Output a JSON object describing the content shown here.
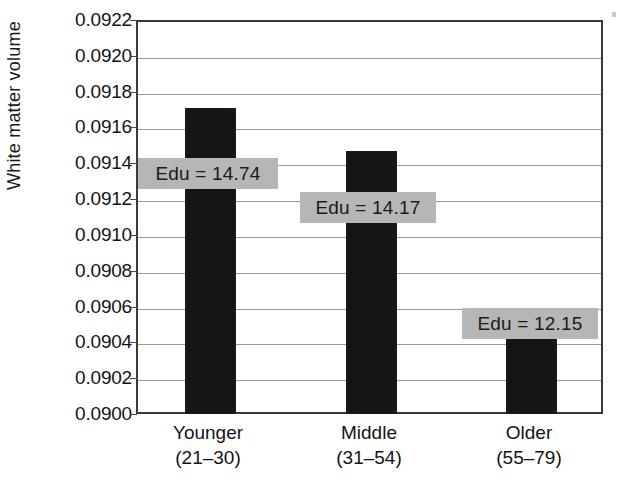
{
  "chart_data": {
    "type": "bar",
    "title": "",
    "xlabel": "",
    "ylabel": "White matter volume",
    "categories": [
      "Younger",
      "Middle",
      "Older"
    ],
    "category_ranges": [
      "(21–30)",
      "(31–54)",
      "(55–79)"
    ],
    "values": [
      0.09172,
      0.09148,
      0.0906
    ],
    "ylim": [
      0.09,
      0.0922
    ],
    "ytick_step": 0.0002,
    "ytick_labels": [
      "0.0922",
      "0.0920",
      "0.0918",
      "0.0916",
      "0.0914",
      "0.0912",
      "0.0910",
      "0.0908",
      "0.0906",
      "0.0904",
      "0.0902",
      "0.0900"
    ],
    "ytick_values": [
      0.0922,
      0.092,
      0.0918,
      0.0916,
      0.0914,
      0.0912,
      0.091,
      0.0908,
      0.0906,
      0.0904,
      0.0902,
      0.09
    ],
    "grid": true,
    "legend": "none",
    "annotations": [
      {
        "label": "Edu = 14.74",
        "value": 14.74,
        "category": "Younger"
      },
      {
        "label": "Edu = 14.17",
        "value": 14.17,
        "category": "Middle"
      },
      {
        "label": "Edu = 12.15",
        "value": 12.15,
        "category": "Older"
      }
    ],
    "colors": {
      "bar": "#151515",
      "annotation_box": "#b6b6b6",
      "gridline": "#9a9a9a",
      "axis": "#3a3a3a",
      "text": "#141414",
      "background": "#ffffff"
    }
  }
}
